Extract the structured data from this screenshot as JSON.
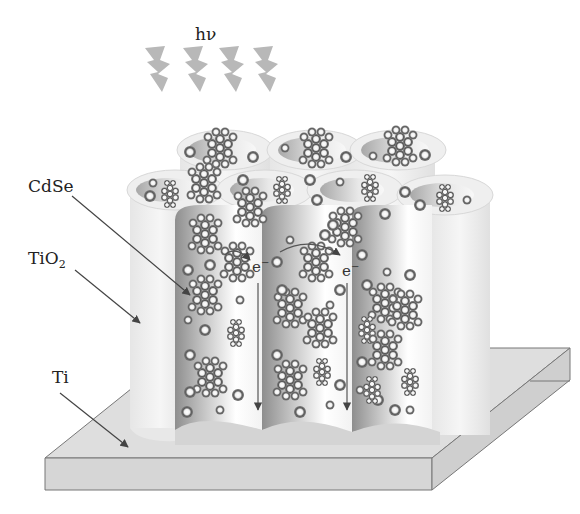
{
  "diagram": {
    "light_label": "hν",
    "labels": {
      "cdse": "CdSe",
      "tio2_main": "TiO",
      "tio2_sub": "2",
      "ti": "Ti"
    },
    "electron_labels": [
      {
        "base": "e",
        "sup": "−"
      },
      {
        "base": "e",
        "sup": "−"
      }
    ],
    "colors": {
      "background": "#ffffff",
      "tube_light": "#eeeeee",
      "tube_inner_dark": "#9a9a9a",
      "substrate": "#dcdcdc",
      "particle_ring": "#5a5a5a",
      "particle_center": "#ffffff",
      "light_bolt": "#b8b8b8",
      "arrow": "#444444",
      "text": "#222222"
    },
    "elements": {
      "light_bolts": 4,
      "nanotubes": 3,
      "components": [
        "CdSe quantum dots",
        "TiO2 nanotubes",
        "Ti substrate"
      ]
    }
  }
}
